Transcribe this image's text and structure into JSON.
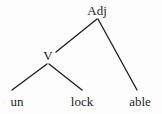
{
  "figure": {
    "type": "morphological-tree-diagram",
    "background_color": "#fdfdfd",
    "ink_color": "#1c1c1c",
    "width": 162,
    "height": 114
  },
  "tree": {
    "root": {
      "id": "adj",
      "label": "Adj",
      "x": 97,
      "y": 19
    },
    "internal": [
      {
        "id": "v",
        "label": "V",
        "x": 48,
        "y": 63
      }
    ],
    "leaves": [
      {
        "id": "un",
        "label": "un",
        "x": 17,
        "y": 96
      },
      {
        "id": "lock",
        "label": "lock",
        "x": 82,
        "y": 96
      },
      {
        "id": "able",
        "label": "able",
        "x": 140,
        "y": 96
      }
    ],
    "edges": [
      {
        "id": "adj-v",
        "from": "adj",
        "to": "v",
        "x1": 97,
        "y1": 19,
        "x2": 56,
        "y2": 52
      },
      {
        "id": "adj-able",
        "from": "adj",
        "to": "able",
        "x1": 98,
        "y1": 19,
        "x2": 137,
        "y2": 90
      },
      {
        "id": "v-un",
        "from": "v",
        "to": "un",
        "x1": 47,
        "y1": 64,
        "x2": 12,
        "y2": 90
      },
      {
        "id": "v-lock",
        "from": "v",
        "to": "lock",
        "x1": 49,
        "y1": 64,
        "x2": 82,
        "y2": 90
      }
    ]
  }
}
